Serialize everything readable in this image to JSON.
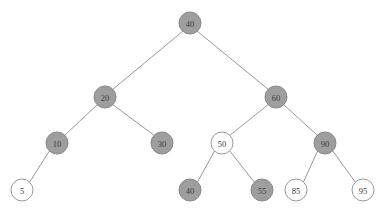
{
  "figure": {
    "name": "binary-search-tree-diagram",
    "background_color": "#ffffff",
    "edge_color": "#9a9a9a",
    "filled_node_color": "#9e9e9e",
    "empty_node_color": "#ffffff",
    "node_border_color": "#9a9a9a",
    "label_color": "#3a3a3a"
  },
  "chart_data": {
    "type": "diagram",
    "title": "",
    "xlabel": "",
    "ylabel": "",
    "nodes": [
      {
        "id": "n40root",
        "label": "40",
        "x": 190,
        "y": 23,
        "r": 11,
        "fill": "filled",
        "level": 0
      },
      {
        "id": "n20",
        "label": "20",
        "x": 105,
        "y": 97,
        "r": 11,
        "fill": "filled",
        "level": 1
      },
      {
        "id": "n60",
        "label": "60",
        "x": 276,
        "y": 97,
        "r": 11,
        "fill": "filled",
        "level": 1
      },
      {
        "id": "n10",
        "label": "10",
        "x": 57,
        "y": 143,
        "r": 11,
        "fill": "filled",
        "level": 2
      },
      {
        "id": "n30",
        "label": "30",
        "x": 162,
        "y": 143,
        "r": 11,
        "fill": "filled",
        "level": 2
      },
      {
        "id": "n50",
        "label": "50",
        "x": 222,
        "y": 143,
        "r": 11,
        "fill": "empty",
        "level": 2
      },
      {
        "id": "n90",
        "label": "90",
        "x": 325,
        "y": 143,
        "r": 11,
        "fill": "filled",
        "level": 2
      },
      {
        "id": "n5",
        "label": "5",
        "x": 22,
        "y": 190,
        "r": 11,
        "fill": "empty",
        "level": 3
      },
      {
        "id": "n40leaf",
        "label": "40",
        "x": 190,
        "y": 190,
        "r": 11,
        "fill": "filled",
        "level": 3
      },
      {
        "id": "n55",
        "label": "55",
        "x": 262,
        "y": 190,
        "r": 11,
        "fill": "filled",
        "level": 3
      },
      {
        "id": "n85",
        "label": "85",
        "x": 296,
        "y": 190,
        "r": 11,
        "fill": "empty",
        "level": 3
      },
      {
        "id": "n95",
        "label": "95",
        "x": 363,
        "y": 190,
        "r": 11,
        "fill": "empty",
        "level": 3
      }
    ],
    "edges": [
      {
        "from": "n40root",
        "to": "n20",
        "x1": 183,
        "y1": 31,
        "x2": 112,
        "y2": 90
      },
      {
        "from": "n40root",
        "to": "n60",
        "x1": 197,
        "y1": 31,
        "x2": 269,
        "y2": 90
      },
      {
        "from": "n20",
        "to": "n10",
        "x1": 98,
        "y1": 104,
        "x2": 64,
        "y2": 136
      },
      {
        "from": "n20",
        "to": "n30",
        "x1": 112,
        "y1": 104,
        "x2": 155,
        "y2": 136
      },
      {
        "from": "n10",
        "to": "n5",
        "x1": 50,
        "y1": 150,
        "x2": 29,
        "y2": 183
      },
      {
        "from": "n60",
        "to": "n50",
        "x1": 269,
        "y1": 104,
        "x2": 229,
        "y2": 136
      },
      {
        "from": "n60",
        "to": "n90",
        "x1": 283,
        "y1": 104,
        "x2": 318,
        "y2": 136
      },
      {
        "from": "n50",
        "to": "n40leaf",
        "x1": 215,
        "y1": 150,
        "x2": 197,
        "y2": 183
      },
      {
        "from": "n50",
        "to": "n55",
        "x1": 229,
        "y1": 150,
        "x2": 255,
        "y2": 183
      },
      {
        "from": "n90",
        "to": "n85",
        "x1": 318,
        "y1": 150,
        "x2": 303,
        "y2": 183
      },
      {
        "from": "n90",
        "to": "n95",
        "x1": 332,
        "y1": 150,
        "x2": 356,
        "y2": 183
      }
    ]
  }
}
